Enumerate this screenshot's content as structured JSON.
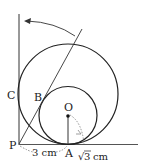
{
  "diagram": {
    "points": {
      "P": "P",
      "A": "A",
      "B": "B",
      "C": "C",
      "O": "O"
    },
    "measurements": {
      "PA": "3 cm",
      "arc": "cm",
      "sqrt_symbol": "√",
      "sqrt_value": "3"
    },
    "colors": {
      "stroke": "#222222",
      "dotted": "#777777"
    }
  }
}
